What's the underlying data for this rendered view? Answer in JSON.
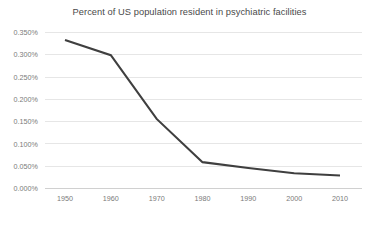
{
  "chart_data": {
    "type": "line",
    "title": "Percent of US population resident in psychiatric facilities",
    "xlabel": "",
    "ylabel": "",
    "categories": [
      "1950",
      "1960",
      "1970",
      "1980",
      "1990",
      "2000",
      "2010"
    ],
    "x": [
      1950,
      1960,
      1970,
      1980,
      1990,
      2000,
      2010
    ],
    "values": [
      0.332,
      0.298,
      0.155,
      0.058,
      0.045,
      0.033,
      0.028
    ],
    "series": [
      {
        "name": "Percent of US population resident in psychiatric facilities",
        "values": [
          0.332,
          0.298,
          0.155,
          0.058,
          0.045,
          0.033,
          0.028
        ],
        "color": "#3f3f3f"
      }
    ],
    "ylim": [
      0.0,
      0.35
    ],
    "xlim": [
      1950,
      2010
    ],
    "ytick_values": [
      0.0,
      0.05,
      0.1,
      0.15,
      0.2,
      0.25,
      0.3,
      0.35
    ],
    "ytick_labels": [
      "0.000%",
      "0.050%",
      "0.100%",
      "0.150%",
      "0.200%",
      "0.250%",
      "0.300%",
      "0.350%"
    ],
    "xtick_labels": [
      "1950",
      "1960",
      "1970",
      "1980",
      "1990",
      "2000",
      "2010"
    ],
    "grid": true,
    "grid_axis": "y",
    "legend": false,
    "legend_position": "none",
    "value_unit": "percent",
    "colors": {
      "series_line": "#3f3f3f",
      "gridline": "#e6e6e6",
      "axis": "#d0d0d0",
      "tick_text": "#7a7a7a",
      "title_text": "#4a4a4a",
      "background": "#ffffff"
    }
  }
}
